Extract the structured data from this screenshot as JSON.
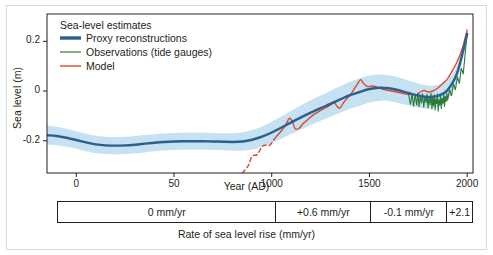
{
  "chart_data": {
    "type": "line",
    "title": "Sea-level estimates",
    "xlabel": "Year (AD)",
    "ylabel": "Sea level (m)",
    "xlim": [
      -150,
      2030
    ],
    "ylim": [
      -0.33,
      0.31
    ],
    "grid": false,
    "legend_position": "top-left",
    "xticks": [
      0,
      500,
      1000,
      1500,
      2000
    ],
    "xtick_labels": [
      "0",
      "50",
      "1000",
      "1500",
      "2000"
    ],
    "yticks": [
      0.2,
      0,
      -0.2
    ],
    "ytick_labels": [
      "0.2",
      "0",
      "-0.2"
    ],
    "series": [
      {
        "name": "Proxy reconstructions",
        "color": "#2b5f8e",
        "style": "solid",
        "band_color": "#bcdcf0",
        "x": [
          -150,
          -100,
          -50,
          0,
          50,
          100,
          150,
          200,
          250,
          300,
          350,
          400,
          450,
          500,
          550,
          600,
          650,
          700,
          750,
          800,
          850,
          900,
          950,
          1000,
          1050,
          1100,
          1150,
          1200,
          1250,
          1300,
          1350,
          1400,
          1450,
          1500,
          1550,
          1600,
          1650,
          1700,
          1750,
          1800,
          1850,
          1900,
          1950,
          2000
        ],
        "y": [
          -0.178,
          -0.181,
          -0.188,
          -0.197,
          -0.207,
          -0.215,
          -0.219,
          -0.22,
          -0.219,
          -0.216,
          -0.212,
          -0.208,
          -0.205,
          -0.203,
          -0.202,
          -0.202,
          -0.202,
          -0.203,
          -0.204,
          -0.205,
          -0.203,
          -0.196,
          -0.184,
          -0.167,
          -0.147,
          -0.126,
          -0.106,
          -0.087,
          -0.069,
          -0.052,
          -0.034,
          -0.017,
          -0.004,
          0.008,
          0.013,
          0.011,
          0.003,
          -0.008,
          -0.018,
          -0.024,
          -0.02,
          0.004,
          0.075,
          0.23
        ],
        "y_upper": [
          -0.14,
          -0.144,
          -0.152,
          -0.162,
          -0.172,
          -0.18,
          -0.184,
          -0.185,
          -0.184,
          -0.181,
          -0.177,
          -0.174,
          -0.171,
          -0.169,
          -0.168,
          -0.168,
          -0.168,
          -0.169,
          -0.17,
          -0.17,
          -0.166,
          -0.157,
          -0.143,
          -0.124,
          -0.102,
          -0.079,
          -0.057,
          -0.037,
          -0.018,
          0.0,
          0.019,
          0.037,
          0.051,
          0.062,
          0.066,
          0.063,
          0.054,
          0.042,
          0.03,
          0.022,
          0.024,
          0.044,
          0.108,
          0.255
        ],
        "y_lower": [
          -0.216,
          -0.218,
          -0.224,
          -0.232,
          -0.242,
          -0.25,
          -0.254,
          -0.255,
          -0.254,
          -0.251,
          -0.247,
          -0.242,
          -0.239,
          -0.237,
          -0.236,
          -0.236,
          -0.236,
          -0.237,
          -0.238,
          -0.24,
          -0.24,
          -0.235,
          -0.225,
          -0.21,
          -0.192,
          -0.173,
          -0.155,
          -0.137,
          -0.12,
          -0.104,
          -0.087,
          -0.071,
          -0.059,
          -0.046,
          -0.04,
          -0.041,
          -0.048,
          -0.058,
          -0.066,
          -0.07,
          -0.064,
          -0.036,
          0.042,
          0.205
        ]
      },
      {
        "name": "Observations (tide gauges)",
        "color": "#2d7a3a",
        "style": "solid",
        "x": [
          1700,
          1710,
          1718,
          1726,
          1734,
          1742,
          1748,
          1754,
          1760,
          1766,
          1772,
          1778,
          1784,
          1790,
          1795,
          1800,
          1805,
          1810,
          1815,
          1820,
          1824,
          1828,
          1832,
          1836,
          1840,
          1844,
          1848,
          1852,
          1856,
          1860,
          1864,
          1868,
          1872,
          1876,
          1880,
          1884,
          1888,
          1892,
          1896,
          1900,
          1910,
          1920,
          1930,
          1940,
          1950,
          1960,
          1970,
          1980,
          1990,
          2000
        ],
        "y": [
          -0.012,
          -0.055,
          -0.008,
          -0.062,
          -0.014,
          -0.058,
          -0.006,
          -0.064,
          -0.018,
          -0.05,
          -0.01,
          -0.066,
          -0.02,
          -0.048,
          -0.012,
          -0.07,
          -0.022,
          -0.056,
          -0.008,
          -0.074,
          -0.026,
          -0.06,
          -0.014,
          -0.078,
          -0.03,
          -0.052,
          -0.01,
          -0.082,
          -0.034,
          -0.058,
          -0.016,
          -0.072,
          -0.028,
          -0.05,
          -0.012,
          -0.064,
          -0.02,
          -0.044,
          -0.006,
          -0.038,
          0.006,
          -0.02,
          0.03,
          0.004,
          0.058,
          0.03,
          0.092,
          0.068,
          0.15,
          0.232
        ]
      },
      {
        "name": "Model",
        "color": "#e0472c",
        "style": "dashed-then-solid",
        "solid_from": 1000,
        "x": [
          850,
          880,
          900,
          925,
          950,
          970,
          990,
          1010,
          1030,
          1050,
          1070,
          1090,
          1105,
          1120,
          1140,
          1160,
          1180,
          1200,
          1225,
          1250,
          1275,
          1300,
          1320,
          1335,
          1350,
          1365,
          1380,
          1400,
          1420,
          1440,
          1455,
          1470,
          1490,
          1510,
          1530,
          1550,
          1575,
          1600,
          1625,
          1650,
          1675,
          1700,
          1720,
          1740,
          1760,
          1780,
          1800,
          1825,
          1850,
          1875,
          1900,
          1925,
          1950,
          1975,
          2000
        ],
        "y": [
          -0.33,
          -0.3,
          -0.262,
          -0.256,
          -0.224,
          -0.218,
          -0.218,
          -0.196,
          -0.178,
          -0.16,
          -0.138,
          -0.11,
          -0.122,
          -0.152,
          -0.15,
          -0.132,
          -0.118,
          -0.104,
          -0.09,
          -0.078,
          -0.068,
          -0.056,
          -0.048,
          -0.062,
          -0.068,
          -0.05,
          -0.034,
          -0.018,
          0.006,
          0.03,
          0.046,
          0.03,
          0.018,
          0.02,
          0.018,
          0.012,
          0.006,
          0.002,
          -0.002,
          -0.006,
          -0.01,
          -0.014,
          -0.012,
          -0.018,
          -0.004,
          0.002,
          -0.004,
          0.0,
          0.012,
          0.03,
          0.05,
          0.082,
          0.12,
          0.17,
          0.245
        ]
      }
    ],
    "rate_bar": {
      "caption": "Rate of sea level rise (mm/yr)",
      "cells": [
        {
          "label": "0 mm/yr",
          "x_start": -150,
          "x_end": 1000
        },
        {
          "label": "+0.6 mm/yr",
          "x_start": 1000,
          "x_end": 1500
        },
        {
          "label": "-0.1 mm/yr",
          "x_start": 1500,
          "x_end": 1900
        },
        {
          "label": "+2.1",
          "x_start": 1900,
          "x_end": 2030
        }
      ]
    }
  }
}
